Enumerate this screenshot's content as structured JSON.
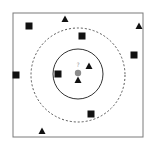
{
  "diagram": {
    "type": "knn-classification",
    "frame": {
      "x": 13,
      "y": 13,
      "width": 130,
      "height": 124,
      "stroke": "#7a7a7a"
    },
    "query_point": {
      "x": 78,
      "y": 73,
      "label": "?",
      "color": "#8c8c8c"
    },
    "inner_circle": {
      "cx": 78,
      "cy": 74,
      "r": 25,
      "style": "solid",
      "stroke": "#333333"
    },
    "outer_circle": {
      "cx": 78,
      "cy": 75,
      "r": 47,
      "style": "dashed",
      "stroke": "#555555"
    },
    "classes": [
      {
        "name": "square",
        "color": "#111111"
      },
      {
        "name": "triangle",
        "color": "#111111"
      }
    ],
    "squares": [
      {
        "x": 29,
        "y": 26
      },
      {
        "x": 82,
        "y": 36
      },
      {
        "x": 134,
        "y": 55
      },
      {
        "x": 16,
        "y": 75
      },
      {
        "x": 58,
        "y": 74
      },
      {
        "x": 91,
        "y": 114
      }
    ],
    "triangles": [
      {
        "x": 65,
        "y": 19
      },
      {
        "x": 139,
        "y": 26
      },
      {
        "x": 89,
        "y": 66
      },
      {
        "x": 78,
        "y": 80
      },
      {
        "x": 42,
        "y": 131
      }
    ]
  }
}
